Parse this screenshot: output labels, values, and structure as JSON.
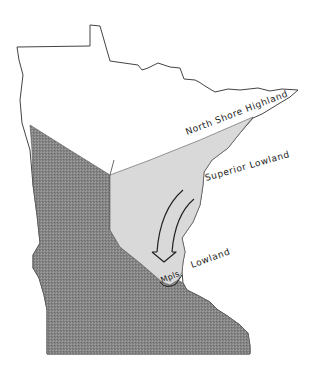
{
  "map": {
    "subject": "Minnesota physiographic regions",
    "colors": {
      "background": "#ffffff",
      "outline": "#444444",
      "lowland_fill": "#d9d9d9",
      "hatched_fill": "#8a8a8a",
      "hatch_line": "#555555",
      "arrow": "#222222",
      "text": "#1a1a1a"
    },
    "labels": {
      "north_shore": "North Shore Highland",
      "superior_lowland": "Superior Lowland",
      "mpls": "Mpls",
      "lowland": "Lowland"
    },
    "regions": [
      {
        "name": "North Shore Highland",
        "fill": "white"
      },
      {
        "name": "Superior Lowland",
        "fill": "light gray"
      },
      {
        "name": "Southwest region",
        "fill": "dark hatched"
      }
    ],
    "arrow": {
      "direction": "southwest",
      "from": "Superior Lowland",
      "to": "Mpls Lowland"
    }
  }
}
